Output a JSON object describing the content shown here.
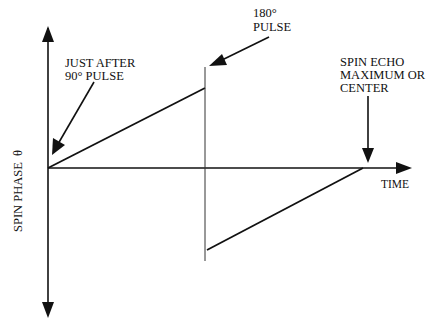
{
  "diagram": {
    "type": "spin-echo phase diagram",
    "y_axis_label": "SPIN PHASE  θ",
    "x_axis_label": "TIME",
    "annotations": {
      "ninety_pulse": [
        "JUST AFTER",
        "90° PULSE"
      ],
      "one_eighty_pulse": [
        "180°",
        "PULSE"
      ],
      "spin_echo": [
        "SPIN ECHO",
        "MAXIMUM OR",
        "CENTER"
      ]
    }
  }
}
